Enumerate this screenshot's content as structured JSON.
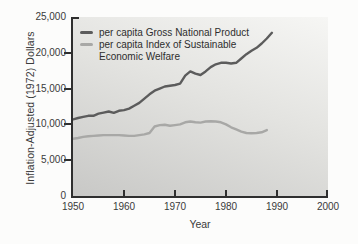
{
  "figure": {
    "y_axis_title": "Inflation-Adjusted (1972) Dollars",
    "x_axis_title": "Year"
  },
  "legend": {
    "item1": "per capita Gross National Product",
    "item2_line1": "per capita Index of Sustainable",
    "item2_line2": "Economic Welfare"
  },
  "colors": {
    "gnp_line": "#5c5c5c",
    "isew_line": "#a8a8a6",
    "axis": "#2f2f2f"
  },
  "chart_data": {
    "type": "line",
    "title": "",
    "xlabel": "Year",
    "ylabel": "Inflation-Adjusted (1972) Dollars",
    "xlim": [
      1950,
      2000
    ],
    "ylim": [
      0,
      25000
    ],
    "grid": false,
    "legend_position": "top-left",
    "x_ticks": [
      1950,
      1960,
      1970,
      1980,
      1990,
      2000
    ],
    "x_tick_labels": [
      "1950",
      "1960",
      "1970",
      "1980",
      "1990",
      "2000"
    ],
    "y_ticks": [
      0,
      5000,
      10000,
      15000,
      20000,
      25000
    ],
    "y_tick_labels": [
      "0",
      "5,000",
      "10,000",
      "15,000",
      "20,000",
      "25,000"
    ],
    "series": [
      {
        "name": "per capita Gross National Product",
        "color": "#5c5c5c",
        "stroke_width": 2.4,
        "points": [
          [
            1950,
            10700
          ],
          [
            1951,
            10900
          ],
          [
            1952,
            11050
          ],
          [
            1953,
            11200
          ],
          [
            1954,
            11200
          ],
          [
            1955,
            11500
          ],
          [
            1956,
            11650
          ],
          [
            1957,
            11800
          ],
          [
            1958,
            11600
          ],
          [
            1959,
            11900
          ],
          [
            1960,
            12000
          ],
          [
            1961,
            12200
          ],
          [
            1962,
            12600
          ],
          [
            1963,
            13000
          ],
          [
            1964,
            13600
          ],
          [
            1965,
            14200
          ],
          [
            1966,
            14700
          ],
          [
            1967,
            15000
          ],
          [
            1968,
            15300
          ],
          [
            1969,
            15400
          ],
          [
            1970,
            15500
          ],
          [
            1971,
            15700
          ],
          [
            1972,
            16800
          ],
          [
            1973,
            17400
          ],
          [
            1974,
            17100
          ],
          [
            1975,
            16900
          ],
          [
            1976,
            17400
          ],
          [
            1977,
            18000
          ],
          [
            1978,
            18400
          ],
          [
            1979,
            18600
          ],
          [
            1980,
            18600
          ],
          [
            1981,
            18500
          ],
          [
            1982,
            18600
          ],
          [
            1983,
            19200
          ],
          [
            1984,
            19800
          ],
          [
            1985,
            20300
          ],
          [
            1986,
            20700
          ],
          [
            1987,
            21300
          ],
          [
            1988,
            22000
          ],
          [
            1989,
            22800
          ]
        ]
      },
      {
        "name": "per capita Index of Sustainable Economic Welfare",
        "color": "#a8a8a6",
        "stroke_width": 2.4,
        "points": [
          [
            1950,
            8000
          ],
          [
            1951,
            8100
          ],
          [
            1952,
            8250
          ],
          [
            1953,
            8350
          ],
          [
            1954,
            8400
          ],
          [
            1955,
            8450
          ],
          [
            1956,
            8500
          ],
          [
            1957,
            8500
          ],
          [
            1958,
            8500
          ],
          [
            1959,
            8500
          ],
          [
            1960,
            8450
          ],
          [
            1961,
            8400
          ],
          [
            1962,
            8400
          ],
          [
            1963,
            8500
          ],
          [
            1964,
            8600
          ],
          [
            1965,
            8800
          ],
          [
            1966,
            9700
          ],
          [
            1967,
            9900
          ],
          [
            1968,
            9950
          ],
          [
            1969,
            9800
          ],
          [
            1970,
            9900
          ],
          [
            1971,
            10000
          ],
          [
            1972,
            10300
          ],
          [
            1973,
            10400
          ],
          [
            1974,
            10300
          ],
          [
            1975,
            10250
          ],
          [
            1976,
            10400
          ],
          [
            1977,
            10450
          ],
          [
            1978,
            10400
          ],
          [
            1979,
            10300
          ],
          [
            1980,
            10000
          ],
          [
            1981,
            9600
          ],
          [
            1982,
            9300
          ],
          [
            1983,
            9000
          ],
          [
            1984,
            8800
          ],
          [
            1985,
            8750
          ],
          [
            1986,
            8800
          ],
          [
            1987,
            8900
          ],
          [
            1988,
            9200
          ]
        ]
      }
    ]
  }
}
